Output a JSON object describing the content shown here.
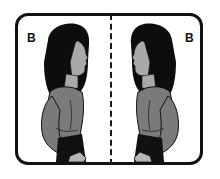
{
  "panels": [
    {
      "id": "left",
      "label": "B",
      "figure": "woman-profile-facing-right"
    },
    {
      "id": "right",
      "label": "B",
      "figure": "woman-profile-facing-left"
    }
  ],
  "divider": {
    "style": "dashed",
    "orientation": "vertical"
  },
  "colors": {
    "frame": "#111111",
    "hair": "#0d0d0d",
    "skin": "#a9a9a9",
    "shirt": "#7a7a7a",
    "background": "#ffffff"
  }
}
